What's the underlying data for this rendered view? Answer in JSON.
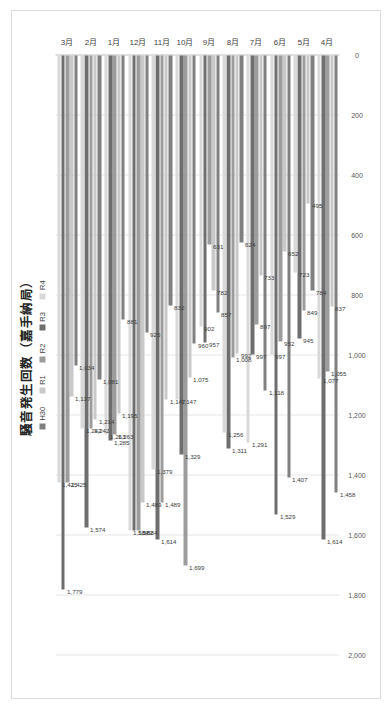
{
  "chart_data": {
    "type": "bar",
    "orientation": "horizontal",
    "title": "騒音発生回数（嘉手納局）",
    "xlabel": "",
    "ylabel": "",
    "xlim": [
      0,
      2000
    ],
    "grid": true,
    "legend_position": "top",
    "axis_ticks": [
      "0",
      "200",
      "400",
      "600",
      "800",
      "1,000",
      "1,200",
      "1,400",
      "1,600",
      "1,800",
      "2,000"
    ],
    "categories": [
      "4月",
      "5月",
      "6月",
      "7月",
      "8月",
      "9月",
      "10月",
      "11月",
      "12月",
      "1月",
      "2月",
      "3月"
    ],
    "series": [
      {
        "name": "H30",
        "color": "#808080",
        "values": [
          1458,
          784,
          1407,
          1118,
          624,
          857,
          960,
          832,
          925,
          881,
          1081,
          1034
        ]
      },
      {
        "name": "R1",
        "color": "#c9c9c9",
        "values": [
          837,
          495,
          652,
          733,
          992,
          782,
          1075,
          1147,
          1489,
          1195,
          1214,
          1137
        ]
      },
      {
        "name": "R2",
        "color": "#9c9c9c",
        "values": [
          1055,
          849,
          952,
          897,
          1008,
          631,
          1699,
          1489,
          1584,
          1263,
          1242,
          1425
        ]
      },
      {
        "name": "R3",
        "color": "#6e6e6e",
        "values": [
          1614,
          945,
          1529,
          997,
          1311,
          957,
          1329,
          1614,
          1582,
          1285,
          1574,
          1779
        ]
      },
      {
        "name": "R4",
        "color": "#d9d9d9",
        "values": [
          1077,
          723,
          997,
          1291,
          1256,
          902,
          1147,
          1379,
          1584,
          1263,
          1242,
          1425
        ]
      }
    ],
    "value_labels": {
      "4月": [
        "1,458",
        "837",
        "1,055",
        "1,614",
        "1,077"
      ],
      "5月": [
        "784",
        "495",
        "849",
        "945",
        "723"
      ],
      "6月": [
        "1,407",
        "652",
        "952",
        "1,529",
        "997"
      ],
      "7月": [
        "1,118",
        "733",
        "897",
        "997",
        "1,291"
      ],
      "8月": [
        "624",
        "992",
        "1,008",
        "1,311",
        "1,256"
      ],
      "9月": [
        "857",
        "782",
        "631",
        "957",
        "902"
      ],
      "10月": [
        "960",
        "1,075",
        "1,699",
        "1,329",
        "1,147"
      ],
      "11月": [
        "832",
        "1,147",
        "1,489",
        "1,614",
        "1,379"
      ],
      "12月": [
        "925",
        "1,489",
        "1,584",
        "1,582",
        "1,584"
      ],
      "1月": [
        "881",
        "1,195",
        "1,263",
        "1,285",
        "1,263"
      ],
      "2月": [
        "1,081",
        "1,214",
        "1,242",
        "1,574",
        "1,242"
      ],
      "3月": [
        "1,034",
        "1,137",
        "1,425",
        "1,779",
        "1,425"
      ]
    }
  },
  "colors": {
    "plot_background": "#ffffff",
    "gridline": "#e6e6e6",
    "axis": "#bfbfbf",
    "text": "#404040",
    "frame_border": "#dcdcdc"
  }
}
